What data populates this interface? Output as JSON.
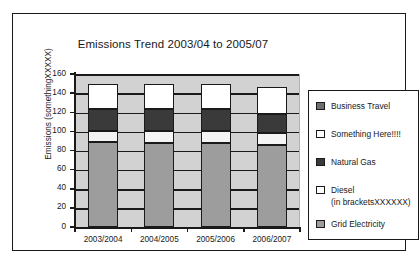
{
  "chart_data": {
    "type": "bar",
    "subtype": "stacked-column",
    "title": "Emissions Trend 2003/04 to 2005/07",
    "xlabel": "",
    "ylabel": "Emissions (somethingXXXXX)",
    "ylim": [
      0,
      160
    ],
    "yticks": [
      0,
      20,
      40,
      60,
      80,
      100,
      120,
      140,
      160
    ],
    "ytick_labels": [
      "0",
      "20",
      "40",
      "60",
      "80",
      "100",
      "120",
      "140",
      "160"
    ],
    "grid": true,
    "legend_position": "right",
    "categories": [
      "2003/2004",
      "2004/2005",
      "2005/2006",
      "2006/2007"
    ],
    "series": [
      {
        "name": "Grid Electricity",
        "color": "#9d9d9d",
        "values": [
          89,
          88,
          88,
          86
        ]
      },
      {
        "name": "Diesel (in bracketsXXXXXX)",
        "color": "#f4f4f4",
        "values": [
          11,
          12,
          12,
          12
        ]
      },
      {
        "name": "Natural Gas",
        "color": "#3a3a3a",
        "values": [
          23,
          23,
          23,
          20
        ]
      },
      {
        "name": "Something Here!!!!",
        "color": "#ffffff",
        "values": [
          27,
          27,
          27,
          28
        ]
      },
      {
        "name": "Business Travel",
        "color": "#6e6e6e",
        "values": [
          0,
          0,
          0,
          0
        ]
      }
    ],
    "totals": [
      150,
      150,
      150,
      146
    ]
  },
  "legend": {
    "items": [
      {
        "label": "Business Travel",
        "swatch": "legend-swatch-business-travel"
      },
      {
        "label": "Something Here!!!!",
        "swatch": "legend-swatch-something-here"
      },
      {
        "label": "Natural Gas",
        "swatch": "legend-swatch-natural-gas"
      },
      {
        "label": "Diesel",
        "swatch": "legend-swatch-diesel"
      },
      {
        "label": "(in bracketsXXXXXX)",
        "swatch": ""
      },
      {
        "label": "Grid Electricity",
        "swatch": "legend-swatch-grid-electricity"
      }
    ]
  },
  "colors": {
    "grid_electricity": "#9d9d9d",
    "diesel": "#f4f4f4",
    "natural_gas": "#3a3a3a",
    "something_here": "#ffffff",
    "business_travel": "#6e6e6e",
    "plot_background": "#d2d2d2",
    "outline": "#1a1a1a"
  }
}
